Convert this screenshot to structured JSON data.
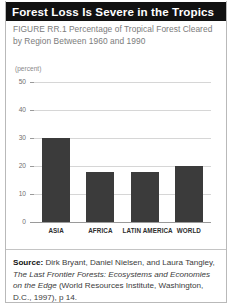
{
  "figure": {
    "title": "Forest Loss Is Severe in the Tropics",
    "caption_label": "FIGURE RR.1",
    "caption_text": "Percentage of Tropical Forest Cleared by Region Between 1960 and 1990",
    "caption_full": "FIGURE RR.1   Percentage of Tropical Forest Cleared by Region Between 1960 and 1990"
  },
  "source": {
    "label": "Source:",
    "authors": "Dirk Bryant, Daniel Nielsen, and Laura Tangley,",
    "work_italic": "The Last Frontier Forests: Ecosystems and Economies on the Edge",
    "publication": "(World Resources Institute, Washington, D.C., 1997), p 14."
  },
  "colors": {
    "title_bar": "#111111",
    "title_text": "#ffffff",
    "bar_fill": "#3b3b3b",
    "gridline": "#d6d6d6",
    "axis": "#9a9a9a",
    "caption_text": "#7b7b7b"
  },
  "chart_data": {
    "type": "bar",
    "title": "Percentage of Tropical Forest Cleared by Region Between 1960 and 1990",
    "xlabel": "",
    "ylabel": "(percent)",
    "unit_label": "(percent)",
    "categories": [
      "ASIA",
      "AFRICA",
      "LATIN AMERICA",
      "WORLD"
    ],
    "values": [
      30,
      18,
      18,
      20
    ],
    "ylim": [
      0,
      50
    ],
    "yticks": [
      0,
      10,
      20,
      30,
      40,
      50
    ],
    "ytick_labels": [
      "0",
      "10",
      "20",
      "30",
      "40",
      "50"
    ],
    "grid": true,
    "legend": "none"
  }
}
